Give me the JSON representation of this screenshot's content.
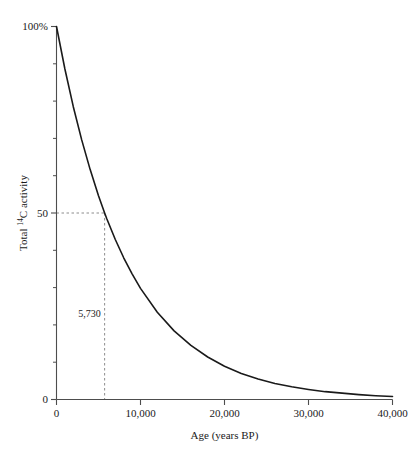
{
  "chart_data": {
    "type": "line",
    "title": "",
    "xlabel": "Age (years BP)",
    "ylabel": "Total 14C activity",
    "ylabel_prefix": "Total ",
    "ylabel_superscript": "14",
    "ylabel_suffix": "C activity",
    "xlim": [
      0,
      40000
    ],
    "ylim": [
      0,
      100
    ],
    "grid": false,
    "legend": null,
    "curve_color": "#1a1a1a",
    "guide_color": "#8c8c8c",
    "axis_color": "#4d4d4d",
    "x_ticks": [
      0,
      10000,
      20000,
      30000,
      40000
    ],
    "x_tick_labels": [
      "0",
      "10,000",
      "20,000",
      "30,000",
      "40,000"
    ],
    "y_ticks": [
      0,
      50,
      100
    ],
    "y_tick_labels": [
      "0",
      "50",
      "100%"
    ],
    "y_minor_ticks": [
      10,
      20,
      30,
      40,
      60,
      70,
      80,
      90
    ],
    "half_life": 5730,
    "annotations": [
      {
        "name": "half-life-label",
        "text": "5,730",
        "x": 5730,
        "y": 22
      }
    ],
    "guides": [
      {
        "name": "half-activity-horizontal-guide",
        "from": [
          0,
          50
        ],
        "to": [
          5730,
          50
        ]
      },
      {
        "name": "half-life-vertical-guide",
        "from": [
          5730,
          50
        ],
        "to": [
          5730,
          0
        ]
      }
    ],
    "x": [
      0,
      1000,
      2000,
      3000,
      4000,
      5000,
      5730,
      6000,
      7000,
      8000,
      9000,
      10000,
      12000,
      14000,
      16000,
      18000,
      20000,
      22000,
      24000,
      26000,
      28000,
      30000,
      32000,
      34000,
      36000,
      38000,
      40000
    ],
    "y": [
      100.0,
      88.6,
      78.5,
      69.6,
      61.7,
      54.6,
      50.0,
      48.4,
      42.9,
      38.0,
      33.7,
      29.8,
      23.4,
      18.4,
      14.5,
      11.4,
      8.9,
      7.0,
      5.5,
      4.3,
      3.4,
      2.7,
      2.1,
      1.7,
      1.3,
      1.0,
      0.8
    ],
    "y_display": [
      100.0,
      88.6,
      78.5,
      69.6,
      61.7,
      54.6,
      50.0,
      48.4,
      42.9,
      38.0,
      33.7,
      29.8,
      23.4,
      18.4,
      14.5,
      11.4,
      8.9,
      7.0,
      5.5,
      4.3,
      3.4,
      2.7,
      2.1,
      1.7,
      1.3,
      1.0,
      0.8
    ]
  }
}
